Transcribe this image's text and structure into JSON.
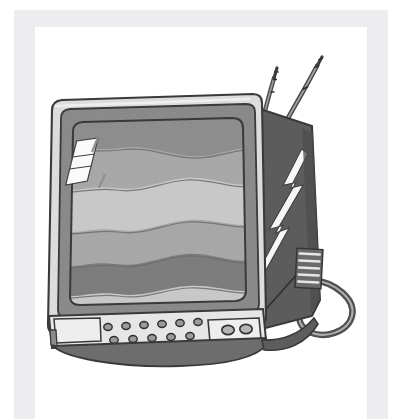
{
  "image": {
    "title": "Vintage CRT Television",
    "subject": "old-fashioned boxy television set with rabbit-ear antennas",
    "style": "grayscale clip-art line illustration with halftone shading",
    "width": 403,
    "height": 419,
    "background_color": "#ffffff"
  },
  "border_frame": {
    "name": "light-gray-page-border",
    "color": "#ededef",
    "top_band": {
      "x": 14,
      "y": 10,
      "width": 374,
      "height": 17
    },
    "left_band": {
      "x": 14,
      "y": 10,
      "width": 21,
      "height": 409
    },
    "right_band": {
      "x": 367,
      "y": 10,
      "width": 21,
      "height": 409
    }
  },
  "palette": {
    "white": "#ffffff",
    "screen_light": "#c9c9c9",
    "screen_mid": "#a8a8a8",
    "screen_dark": "#8e8e8e",
    "screen_darkest": "#7d7d7d",
    "bezel_light": "#d3d3d3",
    "bezel_mid": "#9a9a9a",
    "body_side_dark": "#5e5e5e",
    "body_side_darker": "#525252",
    "base_shadow": "#6e6e6e",
    "panel_light": "#e2e2e2",
    "outline": "#3a3a3a",
    "outline_soft": "#555555",
    "antenna_gray": "#757575",
    "highlight_white": "#f7f7f7"
  },
  "parts": [
    {
      "name": "tv-screen",
      "label": "CRT picture tube screen",
      "description": "rounded rectangle screen filled with wavy horizontal interference bands"
    },
    {
      "name": "screen-glare",
      "label": "Screen glare reflection",
      "description": "white parallelogram streak in upper-left of screen, split by two diagonal lines"
    },
    {
      "name": "tv-bezel",
      "label": "Television bezel",
      "description": "gray frame surrounding the screen"
    },
    {
      "name": "tv-side-panel",
      "label": "Right side panel",
      "description": "dark angled side of the cabinet with a white lightning-bolt highlight"
    },
    {
      "name": "ventilation-grille",
      "label": "Ventilation slots",
      "description": "five horizontal slots on the right side panel"
    },
    {
      "name": "power-cord",
      "label": "Power cord",
      "description": "looping cable exiting the lower right of the cabinet"
    },
    {
      "name": "antenna-left",
      "label": "Left telescoping antenna",
      "description": "segmented rabbit-ear rod angled up and right"
    },
    {
      "name": "antenna-right",
      "label": "Right telescoping antenna",
      "description": "segmented rabbit-ear rod angled up and right"
    },
    {
      "name": "control-panel",
      "label": "Front control panel",
      "description": "light strip below the screen holding the channel buttons and knobs"
    },
    {
      "name": "base-shadow",
      "label": "Cabinet base",
      "description": "dark strip forming the bottom of the cabinet"
    }
  ],
  "screen_bands": [
    {
      "index": 0,
      "tone": "#8e8e8e",
      "label": "band-1-dark"
    },
    {
      "index": 1,
      "tone": "#a8a8a8",
      "label": "band-2-mid"
    },
    {
      "index": 2,
      "tone": "#c9c9c9",
      "label": "band-3-light"
    },
    {
      "index": 3,
      "tone": "#a8a8a8",
      "label": "band-4-mid"
    },
    {
      "index": 4,
      "tone": "#7d7d7d",
      "label": "band-5-darkest"
    },
    {
      "index": 5,
      "tone": "#c9c9c9",
      "label": "band-6-light"
    }
  ],
  "controls": {
    "button_panel": {
      "name": "channel-button-cluster",
      "label": "Channel buttons",
      "rows": [
        {
          "row": "top",
          "count": 6
        },
        {
          "row": "bottom",
          "count": 5
        }
      ],
      "total_buttons": 11
    },
    "knob_panel": {
      "name": "tuning-knob-panel",
      "label": "Tuning knobs",
      "knob_count": 2,
      "knobs": [
        {
          "name": "knob-left",
          "label": "Channel knob"
        },
        {
          "name": "knob-right",
          "label": "Volume knob"
        }
      ]
    }
  },
  "antennas": {
    "count": 2,
    "items": [
      {
        "name": "antenna-left",
        "label": "Antenna 1",
        "segments": 3
      },
      {
        "name": "antenna-right",
        "label": "Antenna 2",
        "segments": 3
      }
    ]
  },
  "vents": {
    "name": "ventilation-grille",
    "slot_count": 5
  }
}
